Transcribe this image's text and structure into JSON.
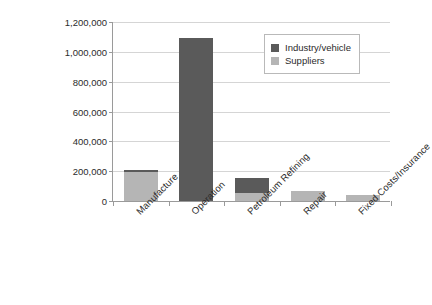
{
  "chart_data": {
    "type": "bar",
    "stacked": true,
    "title": "",
    "xlabel": "",
    "ylabel": "Energy use (MJ)",
    "ylim": [
      0,
      1200000
    ],
    "ytick_labels": [
      "1,200,000",
      "1,000,000",
      "800,000",
      "600,000",
      "400,000",
      "200,000",
      "0"
    ],
    "ytick_values": [
      1200000,
      1000000,
      800000,
      600000,
      400000,
      200000,
      0
    ],
    "grid": true,
    "legend_position": "top-right",
    "categories": [
      "Manufacture",
      "Operation",
      "Petroleum Refining",
      "Repair",
      "Fixed Costs/Insurance"
    ],
    "series": [
      {
        "name": "Suppliers",
        "color": "#b5b5b5",
        "values": [
          195000,
          0,
          55000,
          68000,
          38000
        ]
      },
      {
        "name": "Industry/vehicle",
        "color": "#5a5a5a",
        "values": [
          12000,
          1090000,
          100000,
          0,
          0
        ]
      }
    ],
    "totals": [
      207000,
      1090000,
      155000,
      68000,
      38000
    ]
  },
  "legend": {
    "items": [
      {
        "label": "Industry/vehicle",
        "color": "#5a5a5a"
      },
      {
        "label": "Suppliers",
        "color": "#b5b5b5"
      }
    ]
  }
}
